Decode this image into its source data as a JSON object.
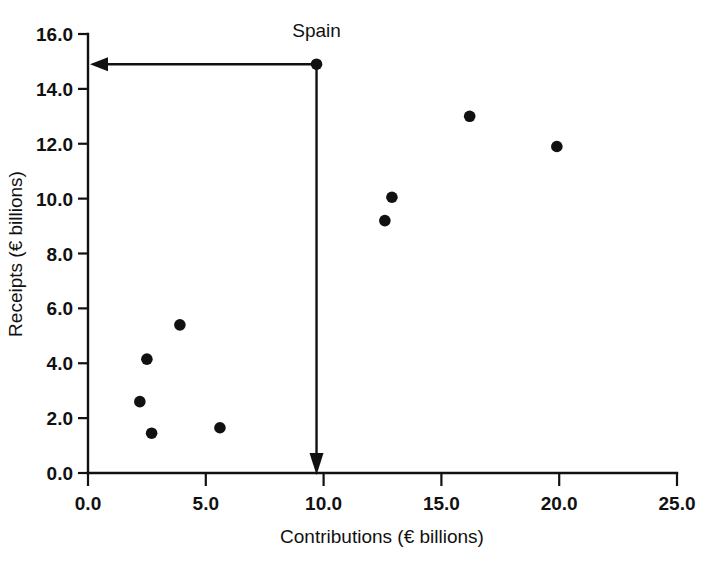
{
  "chart_data": {
    "type": "scatter",
    "title": "",
    "xlabel": "Contributions (€ billions)",
    "ylabel": "Receipts (€ billions)",
    "xlim": [
      0.0,
      25.0
    ],
    "ylim": [
      0.0,
      16.0
    ],
    "xticks": [
      "0.0",
      "5.0",
      "10.0",
      "15.0",
      "20.0",
      "25.0"
    ],
    "yticks": [
      "0.0",
      "2.0",
      "4.0",
      "6.0",
      "8.0",
      "10.0",
      "12.0",
      "14.0",
      "16.0"
    ],
    "xtick_values": [
      0.0,
      5.0,
      10.0,
      15.0,
      20.0,
      25.0
    ],
    "ytick_values": [
      0.0,
      2.0,
      4.0,
      6.0,
      8.0,
      10.0,
      12.0,
      14.0,
      16.0
    ],
    "grid": false,
    "legend": false,
    "marker": "filled-circle",
    "marker_color": "#111111",
    "points": [
      {
        "x": 2.2,
        "y": 2.6
      },
      {
        "x": 2.5,
        "y": 4.15
      },
      {
        "x": 2.7,
        "y": 1.45
      },
      {
        "x": 3.9,
        "y": 5.4
      },
      {
        "x": 5.6,
        "y": 1.65
      },
      {
        "x": 9.7,
        "y": 14.9
      },
      {
        "x": 12.6,
        "y": 9.2
      },
      {
        "x": 12.9,
        "y": 10.05
      },
      {
        "x": 16.2,
        "y": 13.0
      },
      {
        "x": 19.9,
        "y": 11.9
      }
    ],
    "annotations": [
      {
        "label": "Spain",
        "point": {
          "x": 9.7,
          "y": 14.9
        },
        "label_position": {
          "x": 9.7,
          "y": 15.9
        },
        "leader_to_y_axis": true,
        "leader_to_x_axis": true
      }
    ]
  },
  "axis": {
    "x_title": "Contributions (€ billions)",
    "y_title": "Receipts (€ billions)"
  },
  "colors": {
    "ink": "#111111",
    "background": "#ffffff"
  }
}
